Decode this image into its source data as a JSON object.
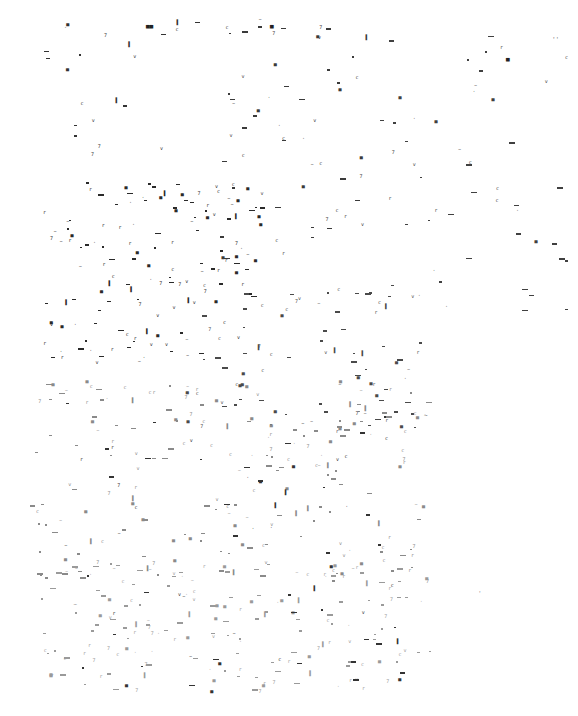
{
  "canvas": {
    "width": 578,
    "height": 716,
    "background": "#ffffff"
  },
  "glyph_set": [
    "c",
    "v",
    "▄",
    "▐",
    "▀",
    "~",
    "7",
    "r",
    "·"
  ],
  "regions": [
    {
      "name": "top-cluster-left",
      "x": 40,
      "y": 15,
      "w": 160,
      "h": 140,
      "count": 22,
      "color": "#333333",
      "seed": 11
    },
    {
      "name": "top-cluster-center",
      "x": 220,
      "y": 15,
      "w": 150,
      "h": 260,
      "count": 60,
      "color": "#3a3a3a",
      "seed": 23
    },
    {
      "name": "top-right",
      "x": 380,
      "y": 30,
      "w": 190,
      "h": 300,
      "count": 48,
      "color": "#404040",
      "seed": 37
    },
    {
      "name": "mid-left-dense",
      "x": 40,
      "y": 180,
      "w": 220,
      "h": 180,
      "count": 140,
      "color": "#2a2a2a",
      "seed": 41
    },
    {
      "name": "mid-center",
      "x": 180,
      "y": 280,
      "w": 250,
      "h": 150,
      "count": 90,
      "color": "#4a4a4a",
      "seed": 53
    },
    {
      "name": "lower-light",
      "x": 30,
      "y": 380,
      "w": 400,
      "h": 200,
      "count": 200,
      "color": "#8a8a8a",
      "seed": 67
    },
    {
      "name": "bottom-faint",
      "x": 40,
      "y": 560,
      "w": 400,
      "h": 130,
      "count": 170,
      "color": "#9a9a9a",
      "seed": 79
    },
    {
      "name": "bottom-dark-accents",
      "x": 60,
      "y": 400,
      "w": 340,
      "h": 290,
      "count": 70,
      "color": "#333333",
      "seed": 97
    }
  ],
  "accent_points": [
    {
      "x": 146,
      "y": 22,
      "glyph": "▄▄",
      "color": "#222222"
    },
    {
      "x": 270,
      "y": 22,
      "glyph": "▄",
      "color": "#222222"
    },
    {
      "x": 506,
      "y": 55,
      "glyph": "▄",
      "color": "#222222"
    },
    {
      "x": 552,
      "y": 35,
      "glyph": "··",
      "color": "#222222"
    },
    {
      "x": 424,
      "y": 412,
      "glyph": "~",
      "color": "#555555"
    },
    {
      "x": 478,
      "y": 589,
      "glyph": "·",
      "color": "#555555"
    }
  ]
}
